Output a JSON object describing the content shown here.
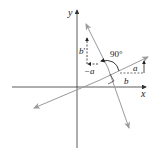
{
  "diagram": {
    "type": "coordinate-geometry",
    "axes": {
      "x_label": "x",
      "y_label": "y"
    },
    "labels": {
      "a": "a",
      "b_right": "b",
      "b_prime": "b",
      "neg_a": "−a",
      "angle": "90°"
    },
    "colors": {
      "axis": "#333333",
      "line": "#9a9a9a",
      "dash": "#333333",
      "text": "#222222"
    }
  }
}
